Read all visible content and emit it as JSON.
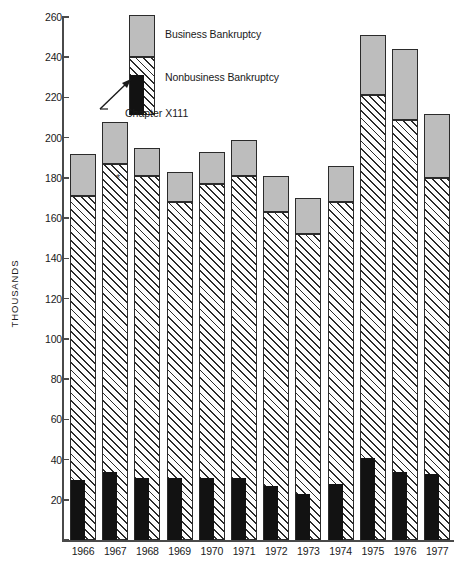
{
  "chart_data": {
    "type": "bar",
    "title": "",
    "subtitle": "",
    "xlabel": "",
    "ylabel": "THOUSANDS",
    "ylim": [
      0,
      260
    ],
    "ytick_step": 20,
    "yticks": [
      0,
      20,
      40,
      60,
      80,
      100,
      120,
      140,
      160,
      180,
      200,
      220,
      240,
      260
    ],
    "grid": false,
    "stacked": true,
    "legend_position": "top-center",
    "categories": [
      "1966",
      "1967",
      "1968",
      "1969",
      "1970",
      "1971",
      "1972",
      "1973",
      "1974",
      "1975",
      "1976",
      "1977"
    ],
    "series": [
      {
        "name": "Chapter X111",
        "fill": "solid-black",
        "values": [
          30,
          34,
          31,
          31,
          31,
          31,
          27,
          23,
          28,
          41,
          34,
          33
        ]
      },
      {
        "name": "Nonbusiness Bankruptcy",
        "fill": "diagonal-hatch",
        "values": [
          171,
          187,
          181,
          168,
          177,
          181,
          163,
          152,
          168,
          221,
          209,
          180
        ]
      },
      {
        "name": "Business Bankruptcy",
        "fill": "solid-gray",
        "values": [
          192,
          208,
          195,
          183,
          193,
          199,
          181,
          170,
          186,
          251,
          244,
          212
        ]
      }
    ],
    "series_note": "Chapter X111 and Nonbusiness Bankruptcy cumulative totals; Business Bankruptcy value is the bar total (top of stack).",
    "annotations": [
      {
        "text": "*",
        "near_category": "1968"
      }
    ]
  },
  "legend": {
    "items": [
      {
        "label": "Business Bankruptcy",
        "swatch": "solid-gray"
      },
      {
        "label": "Nonbusiness Bankruptcy",
        "swatch": "diagonal-hatch"
      },
      {
        "label": "Chapter X111",
        "swatch": "solid-black"
      }
    ],
    "business_label": "Business Bankruptcy",
    "nonbusiness_label": "Nonbusiness Bankruptcy",
    "chapter_label": "Chapter X111"
  },
  "axis": {
    "y_title": "THOUSANDS"
  },
  "footnote": {
    "marker": "*"
  }
}
